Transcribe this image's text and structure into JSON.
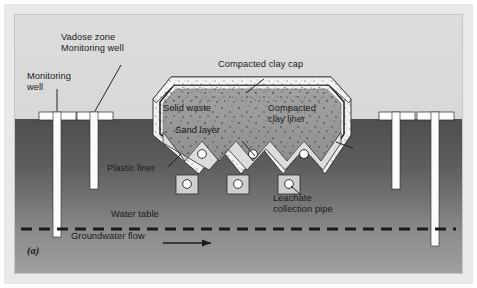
{
  "figure": {
    "panel_id": "(a)",
    "background_color": "#d8d8d8",
    "frame_color": "#e9e9e9"
  },
  "colors": {
    "sky_upper": "#d8d8d8",
    "soil_unsaturated": "#585858",
    "soil_saturated": "#8e8e8e",
    "solid_waste": "#9a9a9a",
    "clay_layer": "#d5d5d5",
    "cap_white": "#f2f2f2",
    "plastic_liner": "#1e1e1e",
    "well_casing": "#fbfbfb",
    "water_table_dash": "#1b1b1b",
    "pipe_fill": "#fdfdfd"
  },
  "labels": {
    "monitoring_well": "Monitoring\nwell",
    "vadose_zone_well": "Vadose zone\nMonitoring well",
    "compacted_clay_cap": "Compacted clay cap",
    "solid_waste": "Solid waste",
    "sand_layer": "Sand layer",
    "compacted_clay_liner": "Compacted\nclay liner",
    "plastic_liner": "Plastic liner",
    "leachate_collection_pipe": "Leachate\ncollection pipe",
    "water_table": "Water table",
    "groundwater_flow": "Groundwater flow"
  },
  "structures": {
    "wells_left": [
      {
        "name": "monitoring-well-left-deep",
        "x": 42,
        "depth_label": "deep"
      },
      {
        "name": "vadose-zone-well-left",
        "x": 79,
        "depth_label": "shallow"
      }
    ],
    "wells_right": [
      {
        "name": "vadose-zone-well-right",
        "x": 396,
        "depth_label": "shallow"
      },
      {
        "name": "monitoring-well-right-deep",
        "x": 433,
        "depth_label": "deep"
      }
    ],
    "leachate_pipes_upper_count": 3,
    "leachate_pipes_lower_count": 3,
    "sand_layer_zigzag_peaks": 3
  }
}
